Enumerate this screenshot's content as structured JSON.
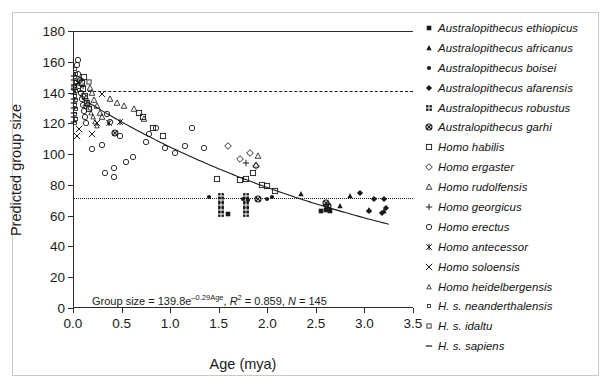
{
  "chart_data": {
    "type": "scatter",
    "title": "",
    "xlabel": "Age (mya)",
    "ylabel": "Predicted group size",
    "xlim": [
      0,
      3.5
    ],
    "ylim": [
      0,
      180
    ],
    "xticks": [
      "0.0",
      "0.5",
      "1.0",
      "1.5",
      "2.0",
      "2.5",
      "3.0",
      "3.5"
    ],
    "xtick_values": [
      0,
      0.5,
      1.0,
      1.5,
      2.0,
      2.5,
      3.0,
      3.5
    ],
    "yticks": [
      "0",
      "20",
      "40",
      "60",
      "80",
      "100",
      "120",
      "140",
      "160",
      "180"
    ],
    "ytick_values": [
      0,
      20,
      40,
      60,
      80,
      100,
      120,
      140,
      160,
      180
    ],
    "grid": false,
    "legend_position": "right",
    "annotation": "Group size = 139.8e^(-0.29Age), R^2 = 0.859, N = 145",
    "equation": {
      "prefix": "Group size = 139.8e",
      "exponent": "–0.29Age",
      "r2_label": "R",
      "r2_sup": "2",
      "r2_value": " = 0.859, ",
      "n_label": "N",
      "n_value": " = 145"
    },
    "fit_curve": {
      "form": "exponential",
      "a": 139.8,
      "b": -0.29,
      "r2": 0.859,
      "n": 145,
      "x_start": 0.1,
      "x_end": 3.25
    },
    "reference_lines": [
      {
        "name": "top-solid",
        "y": 180,
        "style": "solid"
      },
      {
        "name": "dashed-upper",
        "y": 141,
        "style": "dashed"
      },
      {
        "name": "dotted-lower",
        "y": 71.5,
        "style": "dotted"
      }
    ],
    "series": [
      {
        "name": "Australopithecus ethiopicus",
        "marker": "filled-square",
        "points": [
          [
            1.6,
            61
          ],
          [
            2.55,
            63
          ],
          [
            2.6,
            64
          ],
          [
            2.65,
            63
          ]
        ]
      },
      {
        "name": "Australopithecus africanus",
        "marker": "filled-triangle",
        "points": [
          [
            2.35,
            74
          ],
          [
            2.75,
            66
          ],
          [
            2.85,
            73
          ],
          [
            3.05,
            64
          ],
          [
            3.2,
            63
          ]
        ]
      },
      {
        "name": "Australopithecus boisei",
        "marker": "filled-circle",
        "points": [
          [
            1.4,
            72
          ],
          [
            1.75,
            71
          ],
          [
            1.8,
            70
          ],
          [
            2.0,
            71
          ],
          [
            2.05,
            72
          ]
        ]
      },
      {
        "name": "Australopithecus afarensis",
        "marker": "filled-diamond",
        "points": [
          [
            2.95,
            75
          ],
          [
            3.1,
            71
          ],
          [
            3.05,
            63
          ],
          [
            3.2,
            71
          ],
          [
            3.18,
            62
          ],
          [
            3.22,
            65
          ]
        ]
      },
      {
        "name": "Australopithecus robustus",
        "marker": "grid-square",
        "points": [
          [
            1.52,
            73
          ],
          [
            1.52,
            70
          ],
          [
            1.52,
            67
          ],
          [
            1.52,
            64
          ],
          [
            1.52,
            61
          ],
          [
            1.78,
            73
          ],
          [
            1.78,
            70
          ],
          [
            1.78,
            67
          ],
          [
            1.78,
            64
          ],
          [
            1.78,
            61
          ]
        ]
      },
      {
        "name": "Australopithecus garhi",
        "marker": "crossed-circle",
        "points": [
          [
            0.43,
            114
          ],
          [
            2.6,
            68
          ],
          [
            2.62,
            66
          ],
          [
            1.9,
            71
          ]
        ]
      },
      {
        "name": "Homo habilis",
        "marker": "open-square",
        "points": [
          [
            1.48,
            84
          ],
          [
            1.72,
            83
          ],
          [
            1.78,
            84
          ],
          [
            1.85,
            88
          ],
          [
            1.95,
            80
          ],
          [
            2.0,
            79
          ],
          [
            2.08,
            76
          ],
          [
            0.93,
            112
          ],
          [
            0.82,
            117
          ],
          [
            0.68,
            127
          ],
          [
            0.72,
            124
          ],
          [
            0.1,
            142
          ],
          [
            0.12,
            138
          ],
          [
            0.14,
            133
          ],
          [
            0.16,
            129
          ],
          [
            0.09,
            146
          ],
          [
            0.11,
            150
          ]
        ]
      },
      {
        "name": "Homo ergaster",
        "marker": "open-diamond",
        "points": [
          [
            1.72,
            97
          ],
          [
            1.82,
            101
          ],
          [
            1.6,
            105
          ],
          [
            1.88,
            92
          ],
          [
            0.1,
            138
          ],
          [
            0.13,
            131
          ]
        ]
      },
      {
        "name": "Homo rudolfensis",
        "marker": "open-triangle",
        "points": [
          [
            0.63,
            129
          ],
          [
            0.45,
            133
          ],
          [
            0.52,
            131
          ],
          [
            0.38,
            136
          ],
          [
            0.73,
            123
          ],
          [
            1.9,
            99
          ],
          [
            1.88,
            93
          ],
          [
            0.2,
            140
          ],
          [
            0.22,
            135
          ],
          [
            0.25,
            131
          ],
          [
            0.28,
            127
          ],
          [
            0.3,
            124
          ],
          [
            0.18,
            143
          ]
        ]
      },
      {
        "name": "Homo georgicus",
        "marker": "plus",
        "points": [
          [
            1.78,
            94
          ],
          [
            0.08,
            149
          ],
          [
            0.1,
            144
          ]
        ]
      },
      {
        "name": "Homo erectus",
        "marker": "open-circle",
        "points": [
          [
            0.2,
            103
          ],
          [
            0.3,
            106
          ],
          [
            0.42,
            91
          ],
          [
            0.55,
            95
          ],
          [
            0.62,
            98
          ],
          [
            0.75,
            108
          ],
          [
            0.78,
            113
          ],
          [
            0.85,
            117
          ],
          [
            0.95,
            104
          ],
          [
            1.05,
            101
          ],
          [
            1.15,
            105
          ],
          [
            1.22,
            117
          ],
          [
            1.35,
            104
          ],
          [
            0.35,
            126
          ],
          [
            0.38,
            121
          ],
          [
            0.48,
            112
          ],
          [
            0.33,
            88
          ],
          [
            0.42,
            85
          ],
          [
            0.05,
            152
          ],
          [
            0.07,
            148
          ],
          [
            0.06,
            144
          ],
          [
            0.08,
            140
          ],
          [
            0.04,
            158
          ],
          [
            0.05,
            161
          ],
          [
            0.09,
            136
          ],
          [
            0.1,
            132
          ],
          [
            0.11,
            128
          ],
          [
            0.12,
            124
          ],
          [
            0.13,
            120
          ]
        ]
      },
      {
        "name": "Homo antecessor",
        "marker": "asterisk",
        "points": [
          [
            0.37,
            120
          ],
          [
            0.48,
            121
          ],
          [
            0.05,
            146
          ]
        ]
      },
      {
        "name": "Homo soloensis",
        "marker": "cross-x",
        "points": [
          [
            0.25,
            120
          ],
          [
            0.3,
            139
          ],
          [
            0.2,
            113
          ],
          [
            0.06,
            116
          ],
          [
            0.04,
            112
          ]
        ]
      },
      {
        "name": "Homo heidelbergensis",
        "marker": "open-triangle-small",
        "points": [
          [
            0.15,
            134
          ],
          [
            0.17,
            130
          ],
          [
            0.19,
            127
          ],
          [
            0.21,
            124
          ],
          [
            0.23,
            121
          ],
          [
            0.13,
            137
          ],
          [
            0.25,
            118
          ]
        ]
      },
      {
        "name": "H. s. neanderthalensis",
        "marker": "tiny-open-square",
        "points": [
          [
            0.02,
            150
          ],
          [
            0.03,
            147
          ],
          [
            0.02,
            144
          ],
          [
            0.03,
            141
          ],
          [
            0.02,
            138
          ],
          [
            0.03,
            135
          ],
          [
            0.02,
            132
          ],
          [
            0.03,
            129
          ],
          [
            0.02,
            126
          ],
          [
            0.03,
            123
          ],
          [
            0.02,
            120
          ],
          [
            0.03,
            152
          ],
          [
            0.02,
            155
          ]
        ]
      },
      {
        "name": "H. s. idaltu",
        "marker": "open-square-small",
        "points": [
          [
            0.16,
            147
          ],
          [
            0.01,
            143
          ]
        ]
      },
      {
        "name": "H. s. sapiens",
        "marker": "dash",
        "points": [
          [
            0.01,
            148
          ],
          [
            0.01,
            145
          ],
          [
            0.01,
            142
          ],
          [
            0.01,
            139
          ],
          [
            0.01,
            136
          ],
          [
            0.01,
            133
          ],
          [
            0.01,
            130
          ],
          [
            0.01,
            127
          ],
          [
            0.01,
            124
          ],
          [
            0.01,
            121
          ],
          [
            0.01,
            151
          ]
        ]
      }
    ]
  },
  "legend": {
    "items": [
      {
        "label": "Australopithecus ethiopicus",
        "marker": "filled-square"
      },
      {
        "label": "Australopithecus africanus",
        "marker": "filled-triangle"
      },
      {
        "label": "Australopithecus boisei",
        "marker": "filled-circle"
      },
      {
        "label": "Australopithecus afarensis",
        "marker": "filled-diamond"
      },
      {
        "label": "Australopithecus robustus",
        "marker": "grid-square"
      },
      {
        "label": "Australopithecus garhi",
        "marker": "crossed-circle"
      },
      {
        "label": "Homo habilis",
        "marker": "open-square"
      },
      {
        "label": "Homo ergaster",
        "marker": "open-diamond"
      },
      {
        "label": "Homo rudolfensis",
        "marker": "open-triangle"
      },
      {
        "label": "Homo georgicus",
        "marker": "plus"
      },
      {
        "label": "Homo erectus",
        "marker": "open-circle"
      },
      {
        "label": "Homo antecessor",
        "marker": "asterisk"
      },
      {
        "label": "Homo soloensis",
        "marker": "cross-x"
      },
      {
        "label": "Homo heidelbergensis",
        "marker": "open-triangle-small"
      },
      {
        "label": "H. s. neanderthalensis",
        "marker": "tiny-open-square"
      },
      {
        "label": "H. s. idaltu",
        "marker": "open-square-small"
      },
      {
        "label": "H. s. sapiens",
        "marker": "dash"
      }
    ]
  },
  "colors": {
    "ink": "#1a1a1a",
    "axis": "#2b2b2b",
    "frame": "#c9c9c9"
  }
}
